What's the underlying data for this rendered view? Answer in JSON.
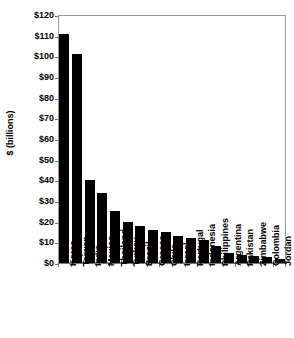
{
  "chart_data": {
    "type": "bar",
    "title": "",
    "subtitle": "",
    "xlabel": "",
    "ylabel": "$ (billions)",
    "ylim": [
      0,
      120
    ],
    "ytick_step": 10,
    "grid": false,
    "legend": null,
    "orientation": "vertical",
    "bar_color": "#000000",
    "categories": [
      "Korea",
      "Taiwan",
      "India",
      "Mexico",
      "Thailand",
      "Turkey",
      "Brazil",
      "Greece",
      "Chile",
      "Israel",
      "Portugal",
      "Indonesia",
      "Philippines",
      "Argentina",
      "Pakistan",
      "Zimbabwe",
      "Colombia",
      "Jordan"
    ],
    "values": [
      111,
      101,
      40,
      34,
      25,
      20,
      18,
      16,
      15,
      13,
      12,
      11,
      8,
      5,
      4,
      3.5,
      3,
      2
    ],
    "ytick_labels": [
      "$0",
      "$10",
      "$20",
      "$30",
      "$40",
      "$50",
      "$60",
      "$70",
      "$80",
      "$90",
      "$100",
      "$110",
      "$120"
    ],
    "ytick_values": [
      0,
      10,
      20,
      30,
      40,
      50,
      60,
      70,
      80,
      90,
      100,
      110,
      120
    ]
  }
}
